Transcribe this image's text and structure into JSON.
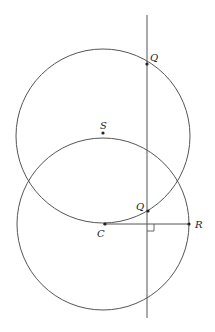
{
  "diagram": {
    "type": "geometry",
    "stroke_color": "#555555",
    "circles": [
      {
        "name": "upper-circle",
        "cx": 103,
        "cy": 136,
        "r": 87
      },
      {
        "name": "lower-circle",
        "cx": 103,
        "cy": 224,
        "r": 86
      }
    ],
    "vertical_line": {
      "x": 147,
      "y1": 15,
      "y2": 318
    },
    "segment_CR": {
      "x1": 103,
      "y1": 224,
      "x2": 189,
      "y2": 224
    },
    "right_angle_mark": {
      "x": 147,
      "y": 224,
      "size": 7
    },
    "points": [
      {
        "id": "Q_top",
        "label": "Q",
        "x": 147,
        "y": 64,
        "lx": 150,
        "ly": 61
      },
      {
        "id": "S",
        "label": "S",
        "x": 103,
        "y": 133,
        "lx": 100,
        "ly": 129
      },
      {
        "id": "Q_bottom",
        "label": "Q",
        "x": 148,
        "y": 211,
        "lx": 136,
        "ly": 210
      },
      {
        "id": "C",
        "label": "C",
        "x": 105,
        "y": 224,
        "lx": 97,
        "ly": 237
      },
      {
        "id": "R",
        "label": "R",
        "x": 189,
        "y": 224,
        "lx": 195,
        "ly": 228
      }
    ]
  }
}
